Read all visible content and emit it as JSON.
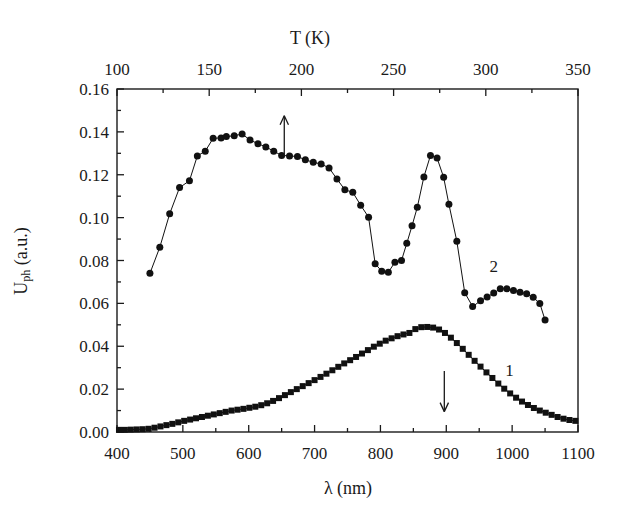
{
  "figure": {
    "background_color": "#ffffff",
    "ink_color": "#1a1a1a"
  },
  "axes": {
    "bottom": {
      "title_prefix": "λ",
      "title_suffix": " (nm)",
      "title": "λ (nm)",
      "tick_labels": [
        "400",
        "500",
        "600",
        "700",
        "800",
        "900",
        "1000",
        "1100"
      ],
      "tick_values": [
        400,
        500,
        600,
        700,
        800,
        900,
        1000,
        1100
      ],
      "minor_tick_values": [
        450,
        550,
        650,
        750,
        850,
        950,
        1050
      ],
      "range": [
        400,
        1100
      ]
    },
    "top": {
      "title": "T (K)",
      "tick_labels": [
        "100",
        "150",
        "200",
        "250",
        "300",
        "350"
      ],
      "tick_values": [
        100,
        150,
        200,
        250,
        300,
        350
      ],
      "minor_tick_values": [
        125,
        175,
        225,
        275,
        325
      ],
      "range": [
        100,
        350
      ]
    },
    "left": {
      "title_main": "U",
      "title_sub": "ph",
      "title_units": " (a.u.)",
      "title": "U_ph (a.u.)",
      "tick_labels": [
        "0.00",
        "0.02",
        "0.04",
        "0.06",
        "0.08",
        "0.10",
        "0.12",
        "0.14",
        "0.16"
      ],
      "tick_values": [
        0.0,
        0.02,
        0.04,
        0.06,
        0.08,
        0.1,
        0.12,
        0.14,
        0.16
      ],
      "minor_tick_values": [
        0.01,
        0.03,
        0.05,
        0.07,
        0.09,
        0.11,
        0.13,
        0.15
      ],
      "range": [
        0.0,
        0.16
      ]
    }
  },
  "annotations": [
    {
      "name": "up-arrow",
      "symbol": "↑",
      "x_nm": 654,
      "y_from": 0.1285,
      "y_to": 0.1475,
      "points_to_series": "2"
    },
    {
      "name": "down-arrow",
      "symbol": "↓",
      "x_nm": 897,
      "y_from": 0.0285,
      "y_to": 0.0095,
      "points_to_series": "1"
    }
  ],
  "series_labels": [
    {
      "text": "2",
      "x_nm": 972,
      "y_value": 0.0775
    },
    {
      "text": "1",
      "x_nm": 996,
      "y_value": 0.0288
    }
  ],
  "chart_data": {
    "type": "line",
    "title": "",
    "subtitle": "",
    "xlabel": "λ (nm)",
    "ylabel": "U_ph (a.u.)",
    "x2label": "T (K)",
    "xlim": [
      400,
      1100
    ],
    "ylim": [
      0.0,
      0.16
    ],
    "x2lim": [
      100,
      350
    ],
    "grid": false,
    "legend": "inline-labels",
    "legend_entries": [
      "1",
      "2"
    ],
    "series": [
      {
        "name": "1",
        "marker": "square",
        "marker_size": 6,
        "color": "#111111",
        "line": true,
        "x": [
          403,
          412,
          421,
          430,
          439,
          448,
          457,
          466,
          475,
          484,
          493,
          502,
          511,
          520,
          529,
          538,
          547,
          556,
          565,
          574,
          583,
          592,
          601,
          610,
          619,
          628,
          637,
          646,
          655,
          664,
          673,
          682,
          691,
          700,
          709,
          718,
          727,
          736,
          745,
          754,
          763,
          772,
          781,
          790,
          799,
          808,
          817,
          826,
          835,
          844,
          853,
          862,
          871,
          880,
          889,
          898,
          907,
          916,
          925,
          934,
          943,
          952,
          961,
          970,
          979,
          988,
          997,
          1006,
          1015,
          1024,
          1033,
          1042,
          1051,
          1060,
          1069,
          1078,
          1087,
          1096
        ],
        "y": [
          0.001,
          0.001,
          0.0011,
          0.0012,
          0.0013,
          0.0015,
          0.002,
          0.0026,
          0.0032,
          0.0038,
          0.0045,
          0.0052,
          0.0058,
          0.0064,
          0.007,
          0.0076,
          0.0082,
          0.0088,
          0.0094,
          0.01,
          0.0104,
          0.0108,
          0.0113,
          0.0118,
          0.0125,
          0.0134,
          0.0145,
          0.0158,
          0.0172,
          0.0186,
          0.02,
          0.0214,
          0.0228,
          0.0242,
          0.0257,
          0.0272,
          0.0288,
          0.0304,
          0.032,
          0.0335,
          0.035,
          0.0366,
          0.0382,
          0.0398,
          0.0412,
          0.0426,
          0.0437,
          0.0447,
          0.0455,
          0.0462,
          0.048,
          0.0489,
          0.049,
          0.0487,
          0.0478,
          0.0462,
          0.044,
          0.0415,
          0.0388,
          0.036,
          0.0332,
          0.0305,
          0.0278,
          0.0252,
          0.0226,
          0.0202,
          0.018,
          0.016,
          0.0142,
          0.0126,
          0.0112,
          0.01,
          0.009,
          0.008,
          0.007,
          0.0062,
          0.0056,
          0.0052
        ],
        "peak": {
          "x": 853,
          "y": 0.049
        }
      },
      {
        "name": "2",
        "marker": "circle",
        "marker_size": 7,
        "color": "#111111",
        "line": true,
        "x": [
          450,
          465,
          480,
          495,
          510,
          522,
          534,
          546,
          558,
          566,
          578,
          590,
          602,
          614,
          626,
          638,
          650,
          662,
          674,
          686,
          698,
          710,
          722,
          734,
          746,
          758,
          770,
          782,
          792,
          802,
          812,
          822,
          832,
          840,
          848,
          856,
          866,
          876,
          886,
          896,
          904,
          916,
          928,
          940,
          952,
          962,
          972,
          982,
          992,
          1002,
          1012,
          1022,
          1032,
          1042,
          1050
        ],
        "y": [
          0.074,
          0.0862,
          0.1018,
          0.114,
          0.1172,
          0.1288,
          0.131,
          0.137,
          0.1372,
          0.1378,
          0.1382,
          0.139,
          0.1362,
          0.1345,
          0.133,
          0.131,
          0.129,
          0.1288,
          0.1285,
          0.127,
          0.1258,
          0.125,
          0.1232,
          0.118,
          0.113,
          0.1118,
          0.1058,
          0.1002,
          0.0785,
          0.075,
          0.0745,
          0.0792,
          0.08,
          0.088,
          0.0962,
          0.1048,
          0.119,
          0.129,
          0.1278,
          0.1188,
          0.1062,
          0.089,
          0.065,
          0.0585,
          0.0612,
          0.063,
          0.0648,
          0.0668,
          0.0668,
          0.066,
          0.0652,
          0.0645,
          0.0628,
          0.06,
          0.0522
        ],
        "primary_peak": {
          "x": 590,
          "y": 0.139
        },
        "local_minimum": {
          "x": 802,
          "y": 0.075
        },
        "secondary_peak": {
          "x": 876,
          "y": 0.129
        },
        "tertiary_peak": {
          "x": 982,
          "y": 0.0668
        }
      }
    ]
  }
}
